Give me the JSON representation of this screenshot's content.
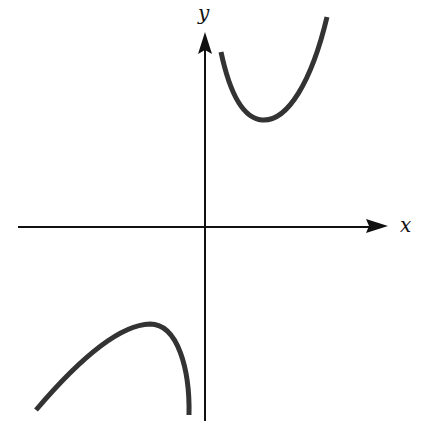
{
  "figure": {
    "axes": {
      "x_label": "x",
      "y_label": "y",
      "x_axis": {
        "x1": 18,
        "y1": 227,
        "x2": 372,
        "y2": 227,
        "arrow_tip": [
          388,
          227
        ]
      },
      "y_axis": {
        "x1": 205,
        "y1": 421,
        "x2": 205,
        "y2": 50,
        "arrow_tip": [
          205,
          33
        ]
      },
      "origin_px": [
        205,
        227
      ]
    },
    "curves": [
      {
        "name": "upper-right-branch",
        "description": "Concave-up branch in quadrant I, descending from near the y-axis to a local minimum then rising steeply",
        "path": "M221,52 C228,85 240,118 262,120 C288,122 312,80 327,17",
        "local_minimum_px": [
          263,
          120
        ]
      },
      {
        "name": "lower-left-branch",
        "description": "Concave-down branch in quadrant III, rising to a local maximum then falling steeply toward the y-axis",
        "path": "M36,410 C70,370 115,325 150,324 C178,324 190,370 189,415",
        "local_maximum_px": [
          150,
          324
        ]
      }
    ],
    "colors": {
      "axis": "#111111",
      "curve": "#333333",
      "background": "#ffffff"
    }
  }
}
